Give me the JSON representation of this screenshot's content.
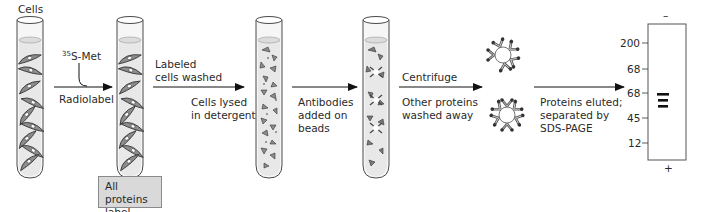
{
  "figure": {
    "steps": {
      "tube1_label": "Cells",
      "isotope_mass": "35",
      "isotope_label": "S-Met",
      "arrow1_label": "Radiolabel",
      "result_box": [
        "All proteins",
        "label"
      ],
      "arrow2_above": [
        "Labeled",
        "cells washed"
      ],
      "arrow2_below": [
        "Cells lysed",
        "in detergent"
      ],
      "arrow3_below": [
        "Antibodies",
        "added on",
        "beads"
      ],
      "arrow4_above": "Centrifuge",
      "arrow4_below": [
        "Other proteins",
        "washed away"
      ],
      "arrow5_below": [
        "Proteins eluted;",
        "separated by",
        "SDS-PAGE"
      ]
    },
    "gel": {
      "top_polarity": "–",
      "bottom_polarity": "+",
      "markers": [
        "200",
        "68",
        "68",
        "45",
        "12"
      ],
      "bands": 3
    },
    "colors": {
      "tube_outline": "#4a4a4a",
      "liquid": "#e8e8e8",
      "cell_fill": "#8c8c8c",
      "box_fill": "#d9d9d9",
      "band": "#111111"
    }
  }
}
